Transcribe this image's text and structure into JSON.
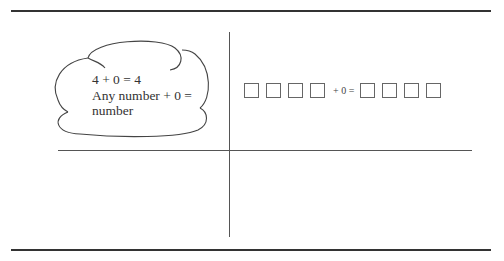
{
  "cloud": {
    "line1": "4 + 0 = 4",
    "line2": "Any number + 0 =",
    "line3": "number"
  },
  "equation": {
    "left_boxes": 4,
    "operator_text": "+ 0 =",
    "right_boxes": 4
  }
}
